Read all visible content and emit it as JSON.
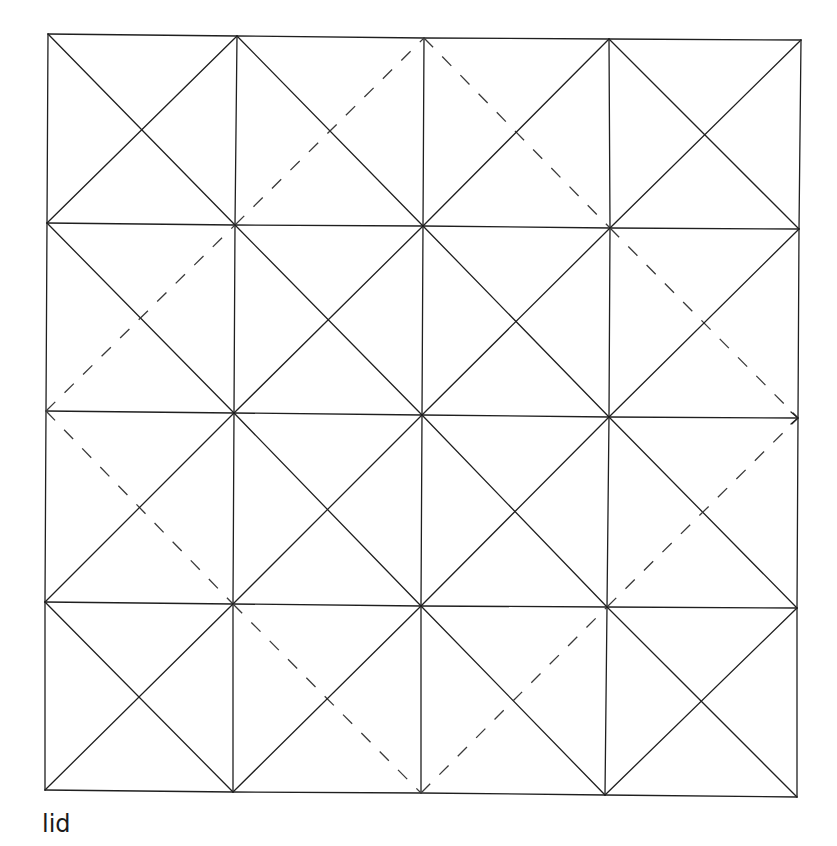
{
  "caption": "lid",
  "colors": {
    "line": "#1f1f1f",
    "dash": "#3a3a3a",
    "background": "#ffffff"
  },
  "grid": {
    "rows": 4,
    "cols": 4,
    "nodes": [
      [
        [
          48,
          34
        ],
        [
          237,
          36
        ],
        [
          424,
          38
        ],
        [
          609,
          39
        ],
        [
          801,
          40
        ]
      ],
      [
        [
          47,
          223
        ],
        [
          235,
          225
        ],
        [
          423,
          226
        ],
        [
          610,
          228
        ],
        [
          799,
          229
        ]
      ],
      [
        [
          46,
          411
        ],
        [
          234,
          413
        ],
        [
          422,
          415
        ],
        [
          609,
          417
        ],
        [
          798,
          418
        ]
      ],
      [
        [
          45,
          602
        ],
        [
          233,
          604
        ],
        [
          421,
          606
        ],
        [
          607,
          607
        ],
        [
          797,
          608
        ]
      ],
      [
        [
          45,
          790
        ],
        [
          233,
          792
        ],
        [
          421,
          793
        ],
        [
          605,
          795
        ],
        [
          797,
          797
        ]
      ]
    ]
  },
  "cells": [
    [
      {
        "main": "solid",
        "anti": "solid"
      },
      {
        "main": "solid",
        "anti": "dashed"
      },
      {
        "main": "dashed",
        "anti": "solid"
      },
      {
        "main": "solid",
        "anti": "solid"
      }
    ],
    [
      {
        "main": "solid",
        "anti": "dashed"
      },
      {
        "main": "solid",
        "anti": "solid"
      },
      {
        "main": "solid",
        "anti": "solid"
      },
      {
        "main": "dashed",
        "anti": "solid"
      }
    ],
    [
      {
        "main": "dashed",
        "anti": "solid"
      },
      {
        "main": "solid",
        "anti": "solid"
      },
      {
        "main": "solid",
        "anti": "solid"
      },
      {
        "main": "solid",
        "anti": "dashed"
      }
    ],
    [
      {
        "main": "solid",
        "anti": "solid"
      },
      {
        "main": "dashed",
        "anti": "solid"
      },
      {
        "main": "solid",
        "anti": "dashed"
      },
      {
        "main": "solid",
        "anti": "solid"
      }
    ]
  ],
  "legend_note": {
    "main": "top-left to bottom-right diagonal",
    "anti": "bottom-left to top-right diagonal"
  },
  "arrow": {
    "row_line": 2,
    "at": "right-end",
    "direction": "right"
  }
}
